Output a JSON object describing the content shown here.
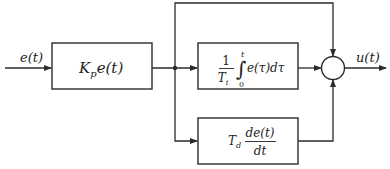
{
  "diagram": {
    "type": "PID controller block diagram",
    "input_signal": "e(t)",
    "output_signal": "u(t)",
    "blocks": [
      {
        "id": "proportional",
        "expr_main": "K",
        "expr_sub": "p",
        "expr_rest": "e(t)"
      },
      {
        "id": "integral",
        "frac_num": "1",
        "frac_den_main": "T",
        "frac_den_sub": "i",
        "int_upper": "t",
        "int_lower": "0",
        "integrand": "e(τ)dτ"
      },
      {
        "id": "derivative",
        "coef_main": "T",
        "coef_sub": "d",
        "frac_num": "de(t)",
        "frac_den": "dt"
      }
    ],
    "summing_junction": {
      "inputs": 3,
      "outputs": 1
    }
  }
}
